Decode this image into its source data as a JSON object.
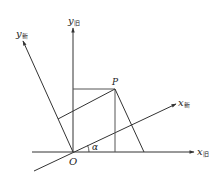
{
  "diagram": {
    "type": "coordinate-rotation",
    "colors": {
      "line": "#333333",
      "text": "#222222",
      "background": "#ffffff"
    },
    "origin": {
      "label": "O"
    },
    "point": {
      "label": "P"
    },
    "angle": {
      "label": "α"
    },
    "axes": {
      "x_old": {
        "base": "x",
        "sub": "旧"
      },
      "y_old": {
        "base": "y",
        "sub": "旧"
      },
      "x_new": {
        "base": "x",
        "sub": "新"
      },
      "y_new": {
        "base": "y",
        "sub": "新"
      }
    }
  }
}
